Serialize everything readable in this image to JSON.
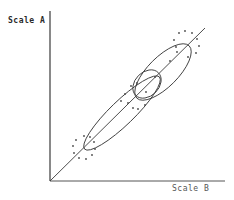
{
  "diagram": {
    "y_axis_label": "Scale A",
    "x_axis_label": "Scale B",
    "colors": {
      "line": "#3a3a3a",
      "dots": "#4a4a4a"
    },
    "elements": {
      "axes": "L-shaped axes with vertical Scale A axis and horizontal Scale B axis",
      "diagonal": "identity line from origin to upper right",
      "ellipses": [
        {
          "name": "long-lower-ellipse",
          "cx": 122,
          "cy": 113,
          "rx": 52,
          "ry": 12,
          "rotate": -44
        },
        {
          "name": "upper-ellipse",
          "cx": 163,
          "cy": 72,
          "rx": 37,
          "ry": 15,
          "rotate": -45
        },
        {
          "name": "small-middle-ellipse",
          "cx": 147,
          "cy": 84,
          "rx": 16,
          "ry": 12,
          "rotate": -45
        }
      ],
      "dot_clusters": [
        {
          "name": "lower-left-dot-ring",
          "cx": 84,
          "cy": 148,
          "r": 11
        },
        {
          "name": "upper-right-dot-ring",
          "cx": 186,
          "cy": 44,
          "r": 13
        }
      ]
    }
  }
}
